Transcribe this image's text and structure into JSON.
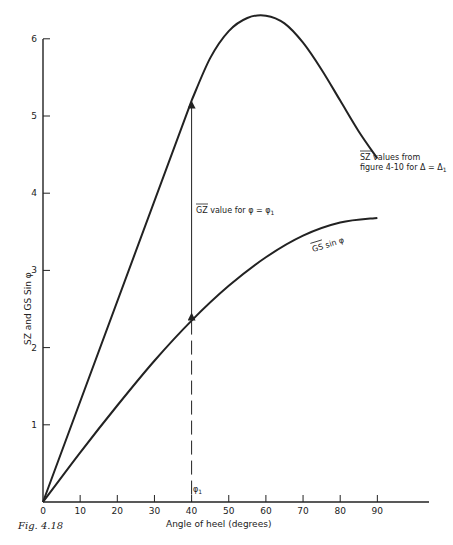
{
  "figure": {
    "caption": "Fig. 4.18"
  },
  "chart_data": {
    "type": "line",
    "title": "",
    "xlabel": "Angle of heel (degrees)",
    "ylabel": "SZ and GS Sin φ",
    "xlim": [
      0,
      100
    ],
    "ylim": [
      0,
      6.3
    ],
    "x_ticks": [
      "0",
      "10",
      "20",
      "30",
      "40",
      "50",
      "60",
      "70",
      "80",
      "90"
    ],
    "y_ticks": [
      "1",
      "2",
      "3",
      "4",
      "5",
      "6"
    ],
    "grid": false,
    "legend": "none (curves labeled inline)",
    "series": [
      {
        "name": "SZ values from figure 4-10 for Δ = Δ₁",
        "x": [
          0,
          10,
          20,
          30,
          40,
          45,
          50,
          55,
          60,
          65,
          70,
          75,
          80,
          85,
          90
        ],
        "values": [
          0,
          1.3,
          2.6,
          3.9,
          5.2,
          5.75,
          6.1,
          6.27,
          6.3,
          6.2,
          5.95,
          5.6,
          5.2,
          4.8,
          4.45
        ]
      },
      {
        "name": "GS sin φ",
        "x": [
          0,
          10,
          20,
          30,
          40,
          50,
          60,
          70,
          80,
          90
        ],
        "values": [
          0,
          0.64,
          1.25,
          1.83,
          2.35,
          2.8,
          3.17,
          3.45,
          3.62,
          3.68
        ]
      }
    ],
    "annotations": [
      {
        "text": "SZ values from",
        "text2": "figure 4-10 for Δ = Δ₁",
        "near": "SZ curve at ~80°"
      },
      {
        "text": "GZ value for φ = φ₁",
        "near": "double arrow at 40° between curves"
      },
      {
        "text": "GS sin φ",
        "near": "lower curve at ~65°"
      },
      {
        "text": "φ₁",
        "near": "x = 40, just above the axis"
      }
    ],
    "markers": {
      "phi1_x": 40,
      "gz_arrow_from": 2.35,
      "gz_arrow_to": 5.2
    }
  },
  "labels": {
    "sz_note_line1": "SZ values from",
    "sz_note_line2": "figure 4-10 for Δ = Δ",
    "sz_note_sub": "1",
    "gz_note_prefix": "GZ",
    "gz_note_rest": " value for φ = φ",
    "gz_note_sub": "1",
    "gs_label_over": "GS",
    "gs_label_rest": " sin φ",
    "phi1_main": "φ",
    "phi1_sub": "1",
    "y_title_sz": "SZ",
    "y_title_and": " and ",
    "y_title_gs": "GS",
    "y_title_sin": " Sin φ",
    "x_title": "Angle of heel (degrees)"
  }
}
